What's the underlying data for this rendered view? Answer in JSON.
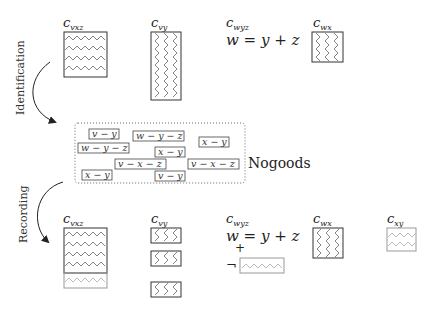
{
  "top_row": {
    "constraints": [
      {
        "name": "c",
        "sub": "vxz"
      },
      {
        "name": "c",
        "sub": "vy"
      },
      {
        "name": "c",
        "sub": "wyz",
        "equation": "w = y + z"
      },
      {
        "name": "c",
        "sub": "wx"
      }
    ]
  },
  "arrows": {
    "identification": "Identification",
    "recording": "Recording"
  },
  "nogoods": {
    "label": "Nogoods",
    "items": [
      "v − y",
      "w − y − z",
      "x − y",
      "w − y − z",
      "x − y",
      "v − x − z",
      "v − x − z",
      "x − y",
      "v − y"
    ]
  },
  "bottom_row": {
    "constraints": [
      {
        "name": "c",
        "sub": "vxz"
      },
      {
        "name": "c",
        "sub": "vy"
      },
      {
        "name": "c",
        "sub": "wyz",
        "equation": "w = y + z",
        "plus": "+",
        "neg": "¬"
      },
      {
        "name": "c",
        "sub": "wx"
      },
      {
        "name": "c",
        "sub": "xy"
      }
    ]
  }
}
